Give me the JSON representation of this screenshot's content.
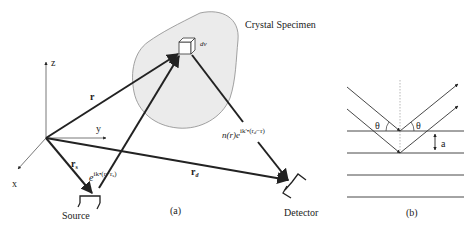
{
  "panel_a": {
    "caption": "(a)",
    "specimen_label": "Crystal Specimen",
    "volume_label": "dv",
    "axes": {
      "x": "x",
      "y": "y",
      "z": "z"
    },
    "vectors": {
      "r": "r",
      "r_s": "r",
      "r_s_sub": "s",
      "r_d": "r",
      "r_d_sub": "d"
    },
    "incident_wave": {
      "base": "e",
      "exponent": "ik•(r−r",
      "exponent_sub": "s",
      "exponent_close": ")"
    },
    "scattered_wave": {
      "prefix": "n(r)",
      "base": "e",
      "exponent": "ik'•(r",
      "exponent_sub": "d",
      "exponent_close": "−r)"
    },
    "source_label": "Source",
    "detector_label": "Detector"
  },
  "panel_b": {
    "caption": "(b)",
    "angle_label_left": "θ",
    "angle_label_right": "θ",
    "spacing_label": "a",
    "plane_count": 4
  },
  "colors": {
    "stroke": "#222222",
    "specimen_fill": "#ebebeb",
    "specimen_outline": "#8a8a8a",
    "thin_line": "#555555"
  }
}
